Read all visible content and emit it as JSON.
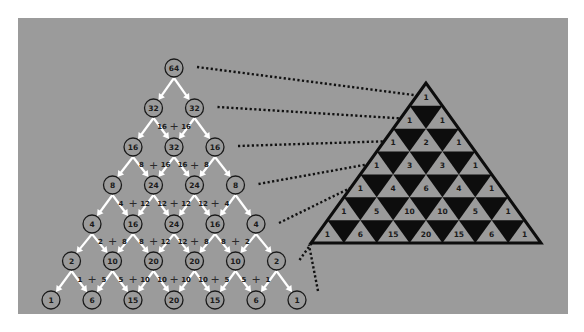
{
  "colors": {
    "page_background": "#ffffff",
    "panel_background": "#9b9b9b",
    "ink": "#1a1a1a",
    "arrow": "#ffffff",
    "dark_triangle": "#0d0d0d"
  },
  "left_diagram": {
    "description": "Binary splitting tree of 64 units",
    "rows": [
      [
        64
      ],
      [
        32,
        32
      ],
      [
        16,
        32,
        16
      ],
      [
        8,
        24,
        24,
        8
      ],
      [
        4,
        16,
        24,
        16,
        4
      ],
      [
        2,
        10,
        20,
        20,
        10,
        2
      ],
      [
        1,
        6,
        15,
        20,
        15,
        6,
        1
      ]
    ],
    "splits": [
      [
        [
          "16",
          "16"
        ]
      ],
      [
        [
          "8",
          "16"
        ],
        [
          "16",
          "8"
        ]
      ],
      [
        [
          "4",
          "12"
        ],
        [
          "12",
          "12"
        ],
        [
          "12",
          "4"
        ]
      ],
      [
        [
          "2",
          "8"
        ],
        [
          "8",
          "12"
        ],
        [
          "12",
          "8"
        ],
        [
          "8",
          "2"
        ]
      ],
      [
        [
          "1",
          "5"
        ],
        [
          "5",
          "10"
        ],
        [
          "10",
          "10"
        ],
        [
          "10",
          "5"
        ],
        [
          "5",
          "1"
        ]
      ]
    ],
    "plus_symbol": "+"
  },
  "right_diagram": {
    "description": "Pascal's triangle with alternating shaded cells",
    "rows": [
      [
        1
      ],
      [
        1,
        1
      ],
      [
        1,
        2,
        1
      ],
      [
        1,
        3,
        3,
        1
      ],
      [
        1,
        4,
        6,
        4,
        1
      ],
      [
        1,
        5,
        10,
        10,
        5,
        1
      ],
      [
        1,
        6,
        15,
        20,
        15,
        6,
        1
      ]
    ]
  },
  "connectors": {
    "count": 7,
    "style": "dotted"
  }
}
